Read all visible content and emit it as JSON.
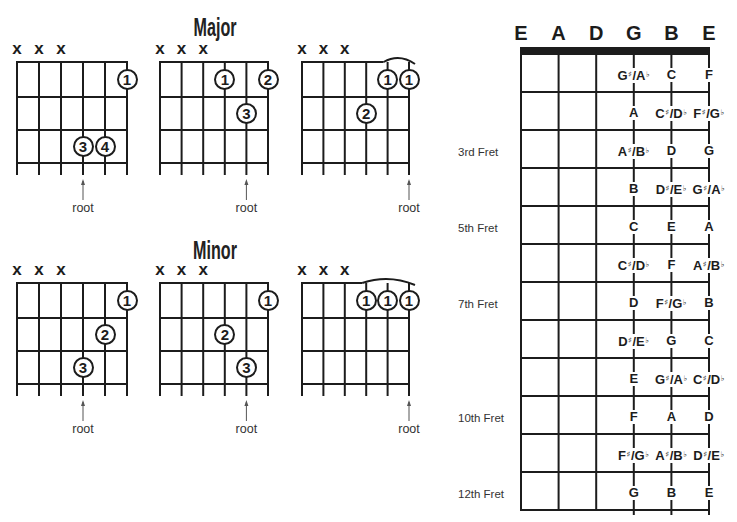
{
  "colors": {
    "ink": "#1c1c1c",
    "soft": "#333333",
    "arrow": "#555555",
    "background": "#ffffff"
  },
  "sections": [
    {
      "title": "Major",
      "chords": [
        {
          "muted": [
            {
              "string": 1,
              "symbol": "x"
            },
            {
              "string": 2,
              "symbol": "x"
            },
            {
              "string": 3,
              "symbol": "x"
            }
          ],
          "fingers": [
            {
              "string": 6,
              "fret": 1,
              "label": "1"
            },
            {
              "string": 4,
              "fret": 3,
              "label": "3"
            },
            {
              "string": 5,
              "fret": 3,
              "label": "4"
            }
          ],
          "barre": null,
          "root_string": 4,
          "root_label": "root"
        },
        {
          "muted": [
            {
              "string": 1,
              "symbol": "x"
            },
            {
              "string": 2,
              "symbol": "x"
            },
            {
              "string": 3,
              "symbol": "x"
            }
          ],
          "fingers": [
            {
              "string": 4,
              "fret": 1,
              "label": "1"
            },
            {
              "string": 6,
              "fret": 1,
              "label": "2"
            },
            {
              "string": 5,
              "fret": 2,
              "label": "3"
            }
          ],
          "barre": null,
          "root_string": 5,
          "root_label": "root"
        },
        {
          "muted": [
            {
              "string": 1,
              "symbol": "x"
            },
            {
              "string": 2,
              "symbol": "x"
            },
            {
              "string": 3,
              "symbol": "x"
            }
          ],
          "fingers": [
            {
              "string": 5,
              "fret": 1,
              "label": "1"
            },
            {
              "string": 6,
              "fret": 1,
              "label": "1"
            },
            {
              "string": 4,
              "fret": 2,
              "label": "2"
            }
          ],
          "barre": {
            "from": 5,
            "to": 6
          },
          "root_string": 6,
          "root_label": "root"
        }
      ]
    },
    {
      "title": "Minor",
      "chords": [
        {
          "muted": [
            {
              "string": 1,
              "symbol": "x"
            },
            {
              "string": 2,
              "symbol": "x"
            },
            {
              "string": 3,
              "symbol": "x"
            }
          ],
          "fingers": [
            {
              "string": 6,
              "fret": 1,
              "label": "1"
            },
            {
              "string": 5,
              "fret": 2,
              "label": "2"
            },
            {
              "string": 4,
              "fret": 3,
              "label": "3"
            }
          ],
          "barre": null,
          "root_string": 4,
          "root_label": "root"
        },
        {
          "muted": [
            {
              "string": 1,
              "symbol": "x"
            },
            {
              "string": 2,
              "symbol": "x"
            },
            {
              "string": 3,
              "symbol": "x"
            }
          ],
          "fingers": [
            {
              "string": 6,
              "fret": 1,
              "label": "1"
            },
            {
              "string": 4,
              "fret": 2,
              "label": "2"
            },
            {
              "string": 5,
              "fret": 3,
              "label": "3"
            }
          ],
          "barre": null,
          "root_string": 5,
          "root_label": "root"
        },
        {
          "muted": [
            {
              "string": 1,
              "symbol": "x"
            },
            {
              "string": 2,
              "symbol": "x"
            },
            {
              "string": 3,
              "symbol": "x"
            }
          ],
          "fingers": [
            {
              "string": 4,
              "fret": 1,
              "label": "1"
            },
            {
              "string": 5,
              "fret": 1,
              "label": "1"
            },
            {
              "string": 6,
              "fret": 1,
              "label": "1"
            }
          ],
          "barre": {
            "from": 4,
            "to": 6
          },
          "root_string": 6,
          "root_label": "root"
        }
      ]
    }
  ],
  "fretboard": {
    "strings": [
      "E",
      "A",
      "D",
      "G",
      "B",
      "E"
    ],
    "rows": [
      {
        "fret": 1,
        "label": "",
        "notes": [
          "G♯/A♭",
          "C",
          "F"
        ]
      },
      {
        "fret": 2,
        "label": "",
        "notes": [
          "A",
          "C♯/D♭",
          "F♯/G♭"
        ]
      },
      {
        "fret": 3,
        "label": "3rd Fret",
        "notes": [
          "A♯/B♭",
          "D",
          "G"
        ]
      },
      {
        "fret": 4,
        "label": "",
        "notes": [
          "B",
          "D♯/E♭",
          "G♯/A♭"
        ]
      },
      {
        "fret": 5,
        "label": "5th Fret",
        "notes": [
          "C",
          "E",
          "A"
        ]
      },
      {
        "fret": 6,
        "label": "",
        "notes": [
          "C♯/D♭",
          "F",
          "A♯/B♭"
        ]
      },
      {
        "fret": 7,
        "label": "7th Fret",
        "notes": [
          "D",
          "F♯/G♭",
          "B"
        ]
      },
      {
        "fret": 8,
        "label": "",
        "notes": [
          "D♯/E♭",
          "G",
          "C"
        ]
      },
      {
        "fret": 9,
        "label": "",
        "notes": [
          "E",
          "G♯/A♭",
          "C♯/D♭"
        ]
      },
      {
        "fret": 10,
        "label": "10th Fret",
        "notes": [
          "F",
          "A",
          "D"
        ]
      },
      {
        "fret": 11,
        "label": "",
        "notes": [
          "F♯/G♭",
          "A♯/B♭",
          "D♯/E♭"
        ]
      },
      {
        "fret": 12,
        "label": "12th Fret",
        "notes": [
          "G",
          "B",
          "E"
        ]
      }
    ]
  }
}
